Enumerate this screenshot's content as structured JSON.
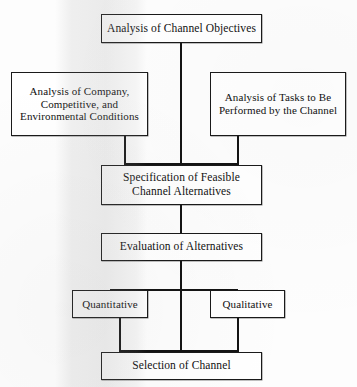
{
  "diagram": {
    "type": "flowchart",
    "nodes": [
      {
        "id": "objectives",
        "label": "Analysis of Channel Objectives"
      },
      {
        "id": "company",
        "label": "Analysis of Company, Competitive, and Environmental Conditions"
      },
      {
        "id": "tasks",
        "label": "Analysis of Tasks to Be Performed by the Channel"
      },
      {
        "id": "specification",
        "label": "Specification of Feasible Channel Alternatives"
      },
      {
        "id": "evaluation",
        "label": "Evaluation of Alternatives"
      },
      {
        "id": "quantitative",
        "label": "Quantitative"
      },
      {
        "id": "qualitative",
        "label": "Qualitative"
      },
      {
        "id": "selection",
        "label": "Selection of Channel"
      }
    ],
    "edges": [
      {
        "from": "objectives",
        "to": "specification"
      },
      {
        "from": "company",
        "to": "specification"
      },
      {
        "from": "tasks",
        "to": "specification"
      },
      {
        "from": "specification",
        "to": "evaluation"
      },
      {
        "from": "evaluation",
        "to": "quantitative"
      },
      {
        "from": "evaluation",
        "to": "qualitative"
      },
      {
        "from": "evaluation",
        "to": "selection"
      },
      {
        "from": "quantitative",
        "to": "selection"
      },
      {
        "from": "qualitative",
        "to": "selection"
      }
    ],
    "colors": {
      "node_border": "#1a1a1a",
      "node_fill": "#ffffff",
      "connector": "#141414",
      "page_background": "#fdfdfd",
      "text": "#111111"
    }
  }
}
